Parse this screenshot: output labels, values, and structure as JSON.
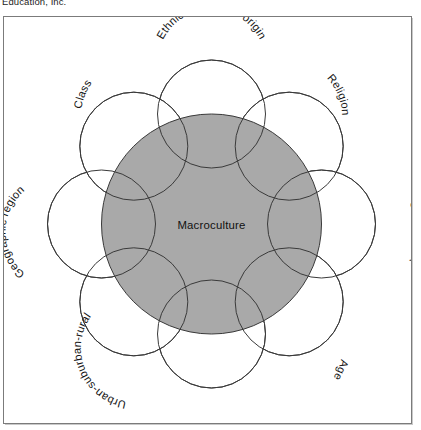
{
  "header": {
    "running_text": "Education, Inc."
  },
  "figure": {
    "center": {
      "label": "Macroculture",
      "fill_color": "#a9a9a9",
      "stroke_color": "#3a3a3a"
    },
    "satellite_stroke_color": "#3a3a3a",
    "satellite_fill_color": "#ffffff",
    "frame_color": "#7b7b7b",
    "background_color": "#ffffff",
    "microcultures": [
      {
        "label": "Ethnic or national origin",
        "position": "top",
        "angle_deg": -90
      },
      {
        "label": "Religion",
        "position": "top-right",
        "angle_deg": -45
      },
      {
        "label": "Gender/Sex",
        "position": "right",
        "angle_deg": 0
      },
      {
        "label": "Age",
        "position": "bottom-right",
        "angle_deg": 45
      },
      {
        "label": "Exceptionality",
        "position": "bottom",
        "angle_deg": 90
      },
      {
        "label": "Urban-suburban-rural",
        "position": "bottom-left",
        "angle_deg": 135
      },
      {
        "label": "Geographic region",
        "position": "left",
        "angle_deg": 180
      },
      {
        "label": "Class",
        "position": "top-left",
        "angle_deg": -135
      }
    ]
  }
}
